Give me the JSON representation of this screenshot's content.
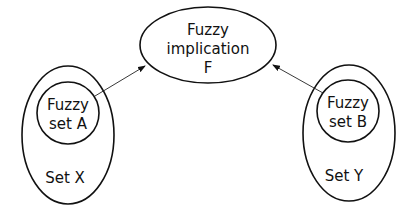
{
  "diagram": {
    "nodes": [
      {
        "id": "implication",
        "shape": "ellipse",
        "lines": [
          "Fuzzy",
          "implication",
          "F"
        ]
      },
      {
        "id": "set_x",
        "shape": "ellipse",
        "label": "Set X",
        "contains": {
          "id": "fuzzy_set_a",
          "shape": "circle",
          "lines": [
            "Fuzzy",
            "set A"
          ]
        }
      },
      {
        "id": "set_y",
        "shape": "ellipse",
        "label": "Set Y",
        "contains": {
          "id": "fuzzy_set_b",
          "shape": "circle",
          "lines": [
            "Fuzzy",
            "set B"
          ]
        }
      }
    ],
    "edges": [
      {
        "from": "fuzzy_set_a",
        "to": "implication",
        "type": "arrow"
      },
      {
        "from": "fuzzy_set_b",
        "to": "implication",
        "type": "arrow"
      }
    ]
  },
  "colors": {
    "stroke": "#111111",
    "background": "#ffffff"
  }
}
